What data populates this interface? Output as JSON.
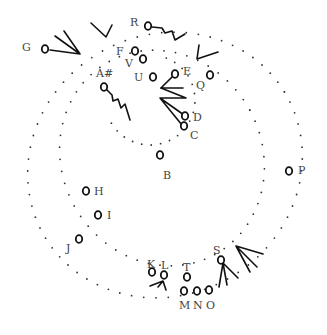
{
  "diagram": {
    "type": "dotted spiral path with labeled nodes",
    "nodes": [
      {
        "id": "A#",
        "label": "A#",
        "x": 104,
        "y": 87,
        "lx": 96,
        "ly": 68
      },
      {
        "id": "B",
        "label": "B",
        "x": 160,
        "y": 155,
        "lx": 163,
        "ly": 170
      },
      {
        "id": "C",
        "label": "C",
        "x": 184,
        "y": 126,
        "lx": 190,
        "ly": 130
      },
      {
        "id": "D",
        "label": "D",
        "x": 185,
        "y": 116,
        "lx": 193,
        "ly": 112
      },
      {
        "id": "E",
        "label": "E",
        "x": 175,
        "y": 74,
        "lx": 183,
        "ly": 66
      },
      {
        "id": "F",
        "label": "F",
        "x": 135,
        "y": 51,
        "lx": 116,
        "ly": 46
      },
      {
        "id": "G",
        "label": "G",
        "x": 45,
        "y": 49,
        "lx": 22,
        "ly": 42
      },
      {
        "id": "H",
        "label": "H",
        "x": 86,
        "y": 191,
        "lx": 94,
        "ly": 186
      },
      {
        "id": "I",
        "label": "I",
        "x": 98,
        "y": 215,
        "lx": 107,
        "ly": 210
      },
      {
        "id": "J",
        "label": "J",
        "x": 79,
        "y": 239,
        "lx": 66,
        "ly": 243
      },
      {
        "id": "K",
        "label": "K",
        "x": 152,
        "y": 272,
        "lx": 147,
        "ly": 259
      },
      {
        "id": "L",
        "label": "L",
        "x": 164,
        "y": 275,
        "lx": 161,
        "ly": 260
      },
      {
        "id": "M",
        "label": "M",
        "x": 184,
        "y": 291,
        "lx": 179,
        "ly": 300
      },
      {
        "id": "N",
        "label": "N",
        "x": 197,
        "y": 291,
        "lx": 193,
        "ly": 300
      },
      {
        "id": "O",
        "label": "O",
        "x": 209,
        "y": 290,
        "lx": 206,
        "ly": 300
      },
      {
        "id": "P",
        "label": "P",
        "x": 289,
        "y": 171,
        "lx": 298,
        "ly": 165
      },
      {
        "id": "Q",
        "label": "Q",
        "x": 210,
        "y": 75,
        "lx": 196,
        "ly": 80
      },
      {
        "id": "R",
        "label": "R",
        "x": 148,
        "y": 26,
        "lx": 130,
        "ly": 17
      },
      {
        "id": "S",
        "label": "S",
        "x": 221,
        "y": 260,
        "lx": 213,
        "ly": 245
      },
      {
        "id": "T",
        "label": "T",
        "x": 187,
        "y": 277,
        "lx": 183,
        "ly": 262
      },
      {
        "id": "U",
        "label": "U",
        "x": 153,
        "y": 77,
        "lx": 134,
        "ly": 72
      },
      {
        "id": "V",
        "label": "V",
        "x": 143,
        "y": 59,
        "lx": 125,
        "ly": 58
      }
    ],
    "colors": {
      "ink": "#111111",
      "dot": "#333333",
      "label": "#444444",
      "background": "#ffffff"
    }
  }
}
